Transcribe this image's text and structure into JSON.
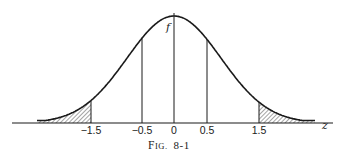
{
  "chart_data": {
    "type": "line",
    "title": "",
    "caption": "Fig. 8-1",
    "caption_display": {
      "first": "F",
      "rest": "IG.",
      "number": "8-1"
    },
    "xlabel": "z",
    "ylabel": "f",
    "x_ticks": [
      "-1.5",
      "-0.5",
      "0",
      "0.5",
      "1.5"
    ],
    "x_tick_values": [
      -1.5,
      -0.5,
      0,
      0.5,
      1.5
    ],
    "vertical_lines_at": [
      -1.5,
      -0.5,
      0,
      0.5,
      1.5
    ],
    "shaded_regions": [
      {
        "from": "-inf",
        "to": -1.5,
        "style": "hatched"
      },
      {
        "from": 1.5,
        "to": "inf",
        "style": "hatched"
      }
    ],
    "series": [
      {
        "name": "f(z) normal density",
        "x": [
          -3.0,
          -2.5,
          -2.0,
          -1.5,
          -1.0,
          -0.5,
          0,
          0.5,
          1.0,
          1.5,
          2.0,
          2.5,
          3.0
        ],
        "y": [
          0.004,
          0.018,
          0.054,
          0.13,
          0.242,
          0.352,
          0.399,
          0.352,
          0.242,
          0.13,
          0.054,
          0.018,
          0.004
        ]
      }
    ],
    "grid": false,
    "legend": null
  },
  "figure": {
    "axis_label_z": "z",
    "curve_label_f": "f",
    "ticks": [
      {
        "label": "-1.5",
        "x": 91
      },
      {
        "label": "-0.5",
        "x": 142
      },
      {
        "label": "0",
        "x": 174
      },
      {
        "label": "0.5",
        "x": 207
      },
      {
        "label": "1.5",
        "x": 259
      }
    ]
  },
  "colors": {
    "ink": "#1a1a1a",
    "background": "#ffffff"
  }
}
